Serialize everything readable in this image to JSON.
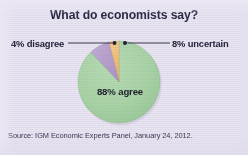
{
  "figure": {
    "title": "What do economists say?",
    "source": "Source: IGM Economic Experts Panel, January 24, 2012.",
    "background_color": "#e9e5f1",
    "title_color": "#2b2a44",
    "label_color": "#24233c",
    "source_color": "#3a3750"
  },
  "labels": {
    "disagree": "4% disagree",
    "uncertain": "8% uncertain",
    "agree": "88% agree"
  },
  "chart_data": {
    "type": "pie",
    "title": "What do economists say?",
    "subtitle": "",
    "xlabel": "",
    "ylabel": "",
    "source": "Source: IGM Economic Experts Panel, January 24, 2012.",
    "legend_position": "callout-annotations",
    "grid": false,
    "total": 100,
    "units": "percent",
    "start_angle_deg": -12,
    "direction": "clockwise",
    "categories": [
      "88% agree",
      "4% disagree",
      "8% uncertain"
    ],
    "values": [
      88,
      4,
      8
    ],
    "slices": [
      {
        "name": "agree",
        "label": "88% agree",
        "value": 88,
        "color": "#a9d4a6",
        "edge_color": "#8ebb8c",
        "label_placement": "inside"
      },
      {
        "name": "disagree",
        "label": "4% disagree",
        "value": 4,
        "color": "#f0c07a",
        "edge_color": "#d9a75e",
        "label_placement": "callout-left"
      },
      {
        "name": "uncertain",
        "label": "8% uncertain",
        "value": 8,
        "color": "#b8a3cc",
        "edge_color": "#9e86b6",
        "label_placement": "callout-right"
      }
    ],
    "annotations": [
      {
        "text": "4% disagree",
        "target_slice": "disagree",
        "side": "left",
        "leader_line": true,
        "marker": "dot"
      },
      {
        "text": "8% uncertain",
        "target_slice": "uncertain",
        "side": "right",
        "leader_line": true,
        "marker": "dot"
      },
      {
        "text": "88% agree",
        "target_slice": "agree",
        "side": "inside",
        "leader_line": false,
        "marker": "none"
      }
    ]
  },
  "geometry": {
    "center_x": 119,
    "center_y": 82,
    "radius": 41
  }
}
